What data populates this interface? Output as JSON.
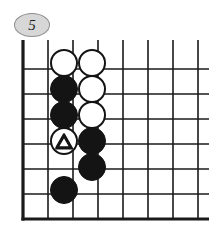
{
  "diagram": {
    "kind": "go-board-problem",
    "badge": {
      "label": "5",
      "shape": "ellipse",
      "fill_color": "#d7d7d7",
      "border_color": "#8f8f8f",
      "text_color": "#1a1a1a"
    },
    "board": {
      "description": "Partial go board, lower-left corner region",
      "columns_visible": 8,
      "rows_visible": 7,
      "edge_left": true,
      "edge_bottom": true,
      "edge_top_cropped": true,
      "edge_right_cropped": true,
      "line_color": "#1a1a1a",
      "background_color": "#ffffff",
      "grid_x": [
        23,
        48,
        73,
        98,
        123,
        148,
        173,
        198
      ],
      "grid_y": [
        44,
        69,
        94,
        119,
        144,
        169,
        194,
        219
      ],
      "thin_line_width": 1.6,
      "edge_line_width": 3.2,
      "horizontal_line_x_start": 23,
      "horizontal_line_x_end": 209,
      "vertical_line_y_start": 40,
      "vertical_line_y_end": 219,
      "horizontal_rows_y": [
        69,
        94,
        119,
        144,
        169,
        194,
        219
      ]
    },
    "stones": [
      {
        "id": "w1",
        "color": "white",
        "col": 2,
        "row": 1,
        "cx": 64,
        "cy": 63,
        "r": 14,
        "mark": "none"
      },
      {
        "id": "w2",
        "color": "white",
        "col": 3,
        "row": 1,
        "cx": 92,
        "cy": 63,
        "r": 14,
        "mark": "none"
      },
      {
        "id": "b1",
        "color": "black",
        "col": 2,
        "row": 2,
        "cx": 64,
        "cy": 89,
        "r": 14,
        "mark": "none"
      },
      {
        "id": "w3",
        "color": "white",
        "col": 3,
        "row": 2,
        "cx": 92,
        "cy": 89,
        "r": 14,
        "mark": "none"
      },
      {
        "id": "b2",
        "color": "black",
        "col": 2,
        "row": 3,
        "cx": 64,
        "cy": 115,
        "r": 14,
        "mark": "none"
      },
      {
        "id": "w4",
        "color": "white",
        "col": 3,
        "row": 3,
        "cx": 92,
        "cy": 115,
        "r": 14,
        "mark": "none"
      },
      {
        "id": "w5",
        "color": "white",
        "col": 2,
        "row": 4,
        "cx": 64,
        "cy": 141,
        "r": 14,
        "mark": "triangle"
      },
      {
        "id": "b3",
        "color": "black",
        "col": 3,
        "row": 4,
        "cx": 92,
        "cy": 141,
        "r": 14,
        "mark": "none"
      },
      {
        "id": "b4",
        "color": "black",
        "col": 3,
        "row": 5,
        "cx": 92,
        "cy": 167,
        "r": 14,
        "mark": "none"
      },
      {
        "id": "b5",
        "color": "black",
        "col": 2,
        "row": 6,
        "cx": 64,
        "cy": 190,
        "r": 14,
        "mark": "none"
      }
    ],
    "marks": {
      "triangle_on": "w5",
      "triangle_color": "#141414",
      "triangle_stroke_width": 1.8
    }
  }
}
